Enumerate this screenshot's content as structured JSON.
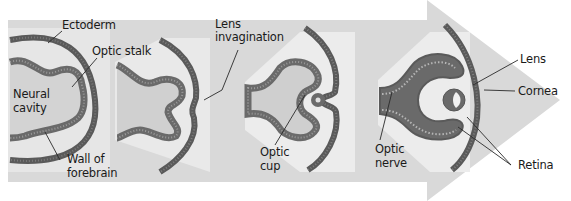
{
  "diagram": {
    "colors": {
      "background": "#ffffff",
      "arrow": "#d9d9d9",
      "panel": "#ececec",
      "tissue_dark": "#5e5e5e",
      "tissue_mid": "#8a8a8a",
      "cavity": "#d2d2d2",
      "leader": "#2a2a2a",
      "text": "#1a1a1a"
    },
    "stages": [
      {
        "id": "stage-1",
        "labels": [
          "Ectoderm",
          "Optic stalk",
          "Neural cavity",
          "Wall of forebrain"
        ]
      },
      {
        "id": "stage-2",
        "labels": [
          "Lens invagination"
        ]
      },
      {
        "id": "stage-3",
        "labels": [
          "Optic cup"
        ]
      },
      {
        "id": "stage-4",
        "labels": [
          "Optic nerve",
          "Lens",
          "Cornea",
          "Retina"
        ]
      }
    ],
    "labels": {
      "ectoderm": "Ectoderm",
      "optic_stalk": "Optic stalk",
      "neural_cavity_1": "Neural",
      "neural_cavity_2": "cavity",
      "wall_1": "Wall of",
      "wall_2": "forebrain",
      "lens_inv_1": "Lens",
      "lens_inv_2": "invagination",
      "optic_cup_1": "Optic",
      "optic_cup_2": "cup",
      "optic_nerve_1": "Optic",
      "optic_nerve_2": "nerve",
      "lens": "Lens",
      "cornea": "Cornea",
      "retina": "Retina"
    }
  }
}
